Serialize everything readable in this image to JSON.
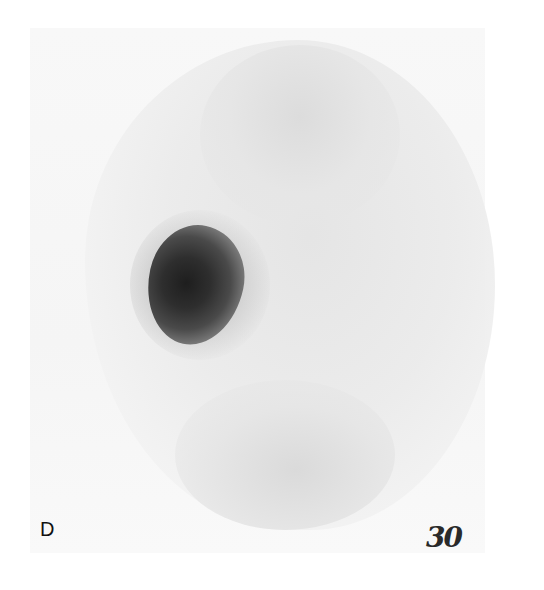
{
  "image": {
    "type": "grayscale scintigraphy scan",
    "panel_label": "D",
    "handwritten_annotation": "30",
    "colors": {
      "background": "#ffffff",
      "film": "#f5f5f5",
      "body_activity": "#e6e6e6",
      "hotspot_core": "#1e1e1e"
    }
  }
}
